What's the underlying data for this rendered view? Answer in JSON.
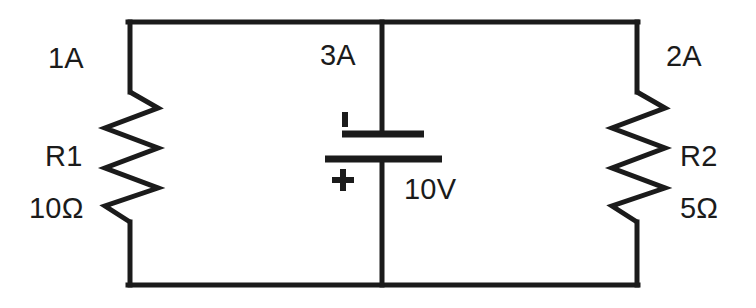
{
  "diagram": {
    "background_color": "#ffffff",
    "wire_color": "#1b1b1b",
    "text_color": "#1b1b1b",
    "wire_width_px": 5
  },
  "labels": {
    "current_left": "1A",
    "current_center": "3A",
    "current_right": "2A",
    "r1_name": "R1",
    "r1_value": "10Ω",
    "r2_name": "R2",
    "r2_value": "5Ω",
    "source_value": "10V",
    "battery_positive": "+",
    "battery_negative": "−"
  },
  "components": [
    {
      "id": "R1",
      "type": "resistor",
      "name": "R1",
      "value": "10Ω",
      "branch_current": "1A",
      "orientation": "vertical",
      "position": "left-branch"
    },
    {
      "id": "R2",
      "type": "resistor",
      "name": "R2",
      "value": "5Ω",
      "branch_current": "2A",
      "orientation": "vertical",
      "position": "right-branch"
    },
    {
      "id": "V1",
      "type": "battery",
      "value": "10V",
      "branch_current": "3A",
      "orientation": "vertical",
      "position": "center-branch",
      "positive_terminal": "bottom",
      "negative_terminal": "top"
    }
  ],
  "nodes": {
    "top_rail_y": 22,
    "bottom_rail_y": 285,
    "left_rail_x": 128,
    "center_rail_x": 382,
    "right_rail_x": 638
  }
}
